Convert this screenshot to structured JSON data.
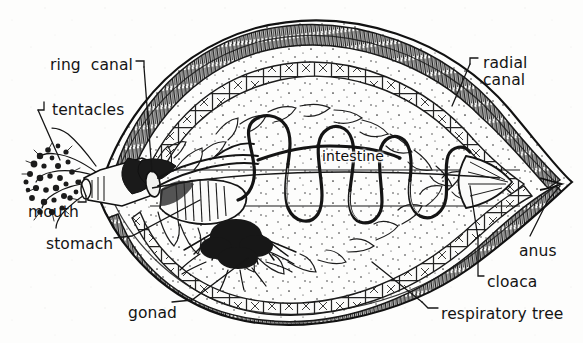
{
  "figure": {
    "background_color": "#fdfdfc",
    "ink_color": "#141414",
    "labels": [
      {
        "id": "ring-canal",
        "text": "ring  canal",
        "x": 50,
        "y": 57,
        "align": "left"
      },
      {
        "id": "tentacles",
        "text": "tentacles",
        "x": 42,
        "y": 102,
        "align": "left"
      },
      {
        "id": "mouth",
        "text": "mouth",
        "x": 28,
        "y": 204,
        "align": "left"
      },
      {
        "id": "stomach",
        "text": "stomach",
        "x": 46,
        "y": 236,
        "align": "left"
      },
      {
        "id": "gonad",
        "text": "gonad",
        "x": 128,
        "y": 305,
        "align": "left"
      },
      {
        "id": "intestine",
        "text": "intestine",
        "x": 322,
        "y": 149,
        "align": "left"
      },
      {
        "id": "radial-canal-1",
        "text": "radial",
        "x": 481,
        "y": 55,
        "align": "left"
      },
      {
        "id": "radial-canal-2",
        "text": "canal",
        "x": 481,
        "y": 72,
        "align": "left"
      },
      {
        "id": "anus",
        "text": "anus",
        "x": 519,
        "y": 243,
        "align": "left"
      },
      {
        "id": "cloaca",
        "text": "cloaca",
        "x": 487,
        "y": 274,
        "align": "left"
      },
      {
        "id": "respiratory-tree",
        "text": "respiratory tree",
        "x": 441,
        "y": 306,
        "align": "left"
      }
    ],
    "structures": [
      "body-wall",
      "tentacle-crown",
      "mouth-opening",
      "pharynx",
      "ring-canal",
      "stomach",
      "intestine-coil",
      "gonad-tufts",
      "respiratory-tree-branches",
      "radial-canal",
      "cloaca",
      "anus"
    ]
  }
}
